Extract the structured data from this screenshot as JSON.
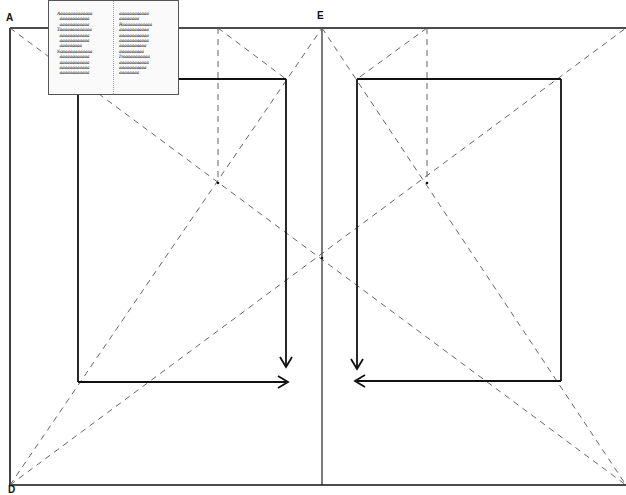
{
  "diagram": {
    "title": "",
    "labels": {
      "corner_top_left": "A",
      "spine_top": "E",
      "corner_bottom_left": "D"
    },
    "colors": {
      "line": "#111111",
      "dashed": "#555555",
      "background": "#ffffff"
    },
    "inset_manuscript": {
      "left_column": [
        "Aaaaaaaaaaaaaa",
        "  aaaaaaaaaaaa",
        "  aaaaaaaaaaaa",
        "Taaaaaaaaaaaaa",
        "  aaaaaaaaaaaa",
        "  aaaaaaaaaaaa",
        "  aaaaaaaaa",
        "Saaaaaaaaaaaaa",
        "  aaaaaaaaaaaa",
        "  aaaaaaaaaaaa",
        "  aaaaaaaaaaaa",
        "  aaaaaaaaaaaa"
      ],
      "right_column": [
        "aaaaaaaaaaaa",
        "aaaaaaaa",
        "Raaaaaaaaaaaa",
        "aaaaaaaaaaaa",
        "aaaaaaaaaaaa",
        "aaaaaaaaaaaa",
        "aaaaaaaaaaa",
        "aaaaaaaaaa",
        "Daaaaaaaaaaa",
        "aaaaaaaaaaaa",
        "aaaaaaaaaaa",
        "aaaaaaaa"
      ]
    }
  },
  "geometry": {
    "spread": {
      "left": 10,
      "top": 28,
      "right": 626,
      "bottom": 485,
      "spine_x": 322
    },
    "left_text_block": {
      "x1": 78,
      "y1": 79,
      "x2": 286,
      "y2": 382
    },
    "right_text_block": {
      "x1": 357,
      "y1": 79,
      "x2": 561,
      "y2": 381
    },
    "intersections": {
      "left_page": [
        218,
        183
      ],
      "right_page": [
        427,
        183
      ],
      "center": [
        322,
        258
      ]
    }
  }
}
